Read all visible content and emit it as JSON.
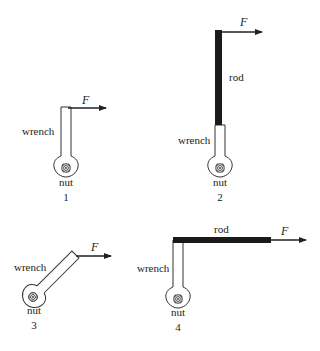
{
  "figures": [
    {
      "id": "1",
      "number": "1",
      "labels": {
        "force": "F",
        "wrench": "wrench",
        "nut": "nut"
      },
      "has_rod": false,
      "orientation": "vertical"
    },
    {
      "id": "2",
      "number": "2",
      "labels": {
        "force": "F",
        "wrench": "wrench",
        "nut": "nut",
        "rod": "rod"
      },
      "has_rod": true,
      "orientation": "vertical rod extending wrench upward"
    },
    {
      "id": "3",
      "number": "3",
      "labels": {
        "force": "F",
        "wrench": "wrench",
        "nut": "nut"
      },
      "has_rod": false,
      "orientation": "diagonal"
    },
    {
      "id": "4",
      "number": "4",
      "labels": {
        "force": "F",
        "wrench": "wrench",
        "nut": "nut",
        "rod": "rod"
      },
      "has_rod": true,
      "orientation": "horizontal rod attached to top of wrench"
    }
  ],
  "colors": {
    "line": "#222222",
    "rod": "#1a1a1a",
    "background": "#ffffff"
  }
}
